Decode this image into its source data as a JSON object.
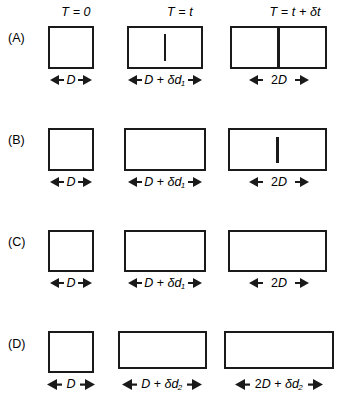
{
  "figure": {
    "type": "scientific-diagram",
    "columns": [
      {
        "id": "t0",
        "label": "T = 0",
        "lhs": "T",
        "eq": "=",
        "rhs": "0"
      },
      {
        "id": "t",
        "label": "T = t",
        "lhs": "T",
        "eq": "=",
        "rhs": "t"
      },
      {
        "id": "tdt",
        "label": "T = t + δt",
        "lhs": "T",
        "eq": "=",
        "rhs": "t + δt"
      }
    ],
    "rows": [
      {
        "id": "A",
        "label": "(A)",
        "panels": [
          {
            "col": "t0",
            "dimension": "D",
            "septum": "none"
          },
          {
            "col": "t",
            "dimension": "D + δd₁",
            "septum": "partial"
          },
          {
            "col": "tdt",
            "dimension": "2D",
            "septum": "full"
          }
        ]
      },
      {
        "id": "B",
        "label": "(B)",
        "panels": [
          {
            "col": "t0",
            "dimension": "D",
            "septum": "none"
          },
          {
            "col": "t",
            "dimension": "D + δd₁",
            "septum": "none"
          },
          {
            "col": "tdt",
            "dimension": "2D",
            "septum": "partial"
          }
        ]
      },
      {
        "id": "C",
        "label": "(C)",
        "panels": [
          {
            "col": "t0",
            "dimension": "D",
            "septum": "none"
          },
          {
            "col": "t",
            "dimension": "D + δd₁",
            "septum": "none"
          },
          {
            "col": "tdt",
            "dimension": "2D",
            "septum": "none"
          }
        ]
      },
      {
        "id": "D",
        "label": "(D)",
        "panels": [
          {
            "col": "t0",
            "dimension": "D",
            "septum": "none"
          },
          {
            "col": "t",
            "dimension": "D + δd₂",
            "septum": "none"
          },
          {
            "col": "tdt",
            "dimension": "2D + δd₂",
            "septum": "none"
          }
        ]
      }
    ],
    "symbols": {
      "length": "D",
      "increment_1": "δd₁",
      "increment_2": "δd₂",
      "time_increment": "δt"
    },
    "colors": {
      "stroke": "#1a1a1a",
      "fill": "#ffffff",
      "background": "#ffffff"
    }
  }
}
